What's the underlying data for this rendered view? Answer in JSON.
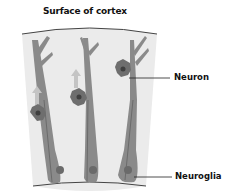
{
  "diagram": {
    "title": "Surface of cortex",
    "labels": {
      "neuron": "Neuron",
      "neuroglia": "Neuroglia"
    },
    "colors": {
      "tissue_background": "#ebebeb",
      "glia_fill": "#8a8a8a",
      "neuron_fill": "#6e6e6e",
      "nucleus": "#4a4a4a",
      "arrow": "#c4c4c4",
      "leader_line": "#222222"
    }
  }
}
